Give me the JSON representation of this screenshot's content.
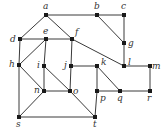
{
  "diagram": {
    "type": "undirected-graph",
    "colors": {
      "edge": "#3a3a3a",
      "node": "#1a1a1a",
      "label": "#333333"
    },
    "nodes": [
      {
        "id": "a",
        "label": "a",
        "x": 46,
        "y": 15,
        "lx": 43,
        "ly": 9
      },
      {
        "id": "b",
        "label": "b",
        "x": 97,
        "y": 15,
        "lx": 94,
        "ly": 9
      },
      {
        "id": "c",
        "label": "c",
        "x": 124,
        "y": 15,
        "lx": 121,
        "ly": 9
      },
      {
        "id": "d",
        "label": "d",
        "x": 20,
        "y": 39,
        "lx": 10,
        "ly": 42
      },
      {
        "id": "e",
        "label": "e",
        "x": 46,
        "y": 39,
        "lx": 43,
        "ly": 34
      },
      {
        "id": "f",
        "label": "f",
        "x": 72,
        "y": 39,
        "lx": 75,
        "ly": 35
      },
      {
        "id": "g",
        "label": "g",
        "x": 124,
        "y": 43,
        "lx": 128,
        "ly": 46
      },
      {
        "id": "h",
        "label": "h",
        "x": 19,
        "y": 65,
        "lx": 9,
        "ly": 67
      },
      {
        "id": "i",
        "label": "i",
        "x": 44,
        "y": 66,
        "lx": 37,
        "ly": 68
      },
      {
        "id": "j",
        "label": "j",
        "x": 71,
        "y": 66,
        "lx": 64,
        "ly": 68
      },
      {
        "id": "k",
        "label": "k",
        "x": 97,
        "y": 66,
        "lx": 101,
        "ly": 65
      },
      {
        "id": "l",
        "label": "l",
        "x": 124,
        "y": 66,
        "lx": 128,
        "ly": 65
      },
      {
        "id": "m",
        "label": "m",
        "x": 150,
        "y": 66,
        "lx": 152,
        "ly": 69
      },
      {
        "id": "n",
        "label": "n",
        "x": 44,
        "y": 91,
        "lx": 34,
        "ly": 93
      },
      {
        "id": "o",
        "label": "o",
        "x": 70,
        "y": 91,
        "lx": 73,
        "ly": 94
      },
      {
        "id": "p",
        "label": "p",
        "x": 97,
        "y": 91,
        "lx": 100,
        "ly": 101
      },
      {
        "id": "q",
        "label": "q",
        "x": 120,
        "y": 91,
        "lx": 117,
        "ly": 101
      },
      {
        "id": "r",
        "label": "r",
        "x": 150,
        "y": 91,
        "lx": 147,
        "ly": 101
      },
      {
        "id": "s",
        "label": "s",
        "x": 19,
        "y": 117,
        "lx": 16,
        "ly": 127
      },
      {
        "id": "t",
        "label": "t",
        "x": 95,
        "y": 117,
        "lx": 93,
        "ly": 127
      }
    ],
    "edges": [
      [
        "a",
        "b"
      ],
      [
        "b",
        "c"
      ],
      [
        "b",
        "g"
      ],
      [
        "c",
        "g"
      ],
      [
        "g",
        "l"
      ],
      [
        "a",
        "d"
      ],
      [
        "a",
        "f"
      ],
      [
        "d",
        "e"
      ],
      [
        "e",
        "f"
      ],
      [
        "f",
        "l"
      ],
      [
        "d",
        "h"
      ],
      [
        "e",
        "h"
      ],
      [
        "e",
        "i"
      ],
      [
        "f",
        "j"
      ],
      [
        "i",
        "n"
      ],
      [
        "i",
        "o"
      ],
      [
        "j",
        "o"
      ],
      [
        "j",
        "k"
      ],
      [
        "n",
        "o"
      ],
      [
        "h",
        "n"
      ],
      [
        "h",
        "s"
      ],
      [
        "n",
        "s"
      ],
      [
        "s",
        "t"
      ],
      [
        "o",
        "t"
      ],
      [
        "k",
        "p"
      ],
      [
        "k",
        "q"
      ],
      [
        "p",
        "q"
      ],
      [
        "p",
        "t"
      ],
      [
        "q",
        "r"
      ],
      [
        "l",
        "m"
      ],
      [
        "m",
        "r"
      ]
    ]
  }
}
